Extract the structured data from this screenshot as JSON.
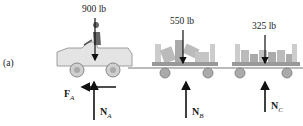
{
  "figure": {
    "part_label": "(a)",
    "loads": [
      {
        "id": "tractor",
        "label": "900 lb"
      },
      {
        "id": "cart_b",
        "label": "550 lb"
      },
      {
        "id": "cart_c",
        "label": "325 lb"
      }
    ],
    "forces": [
      {
        "id": "FA",
        "symbol": "F",
        "subscript": "A"
      },
      {
        "id": "NA",
        "symbol": "N",
        "subscript": "A"
      },
      {
        "id": "NB",
        "symbol": "N",
        "subscript": "B"
      },
      {
        "id": "NC",
        "symbol": "N",
        "subscript": "C"
      }
    ]
  }
}
